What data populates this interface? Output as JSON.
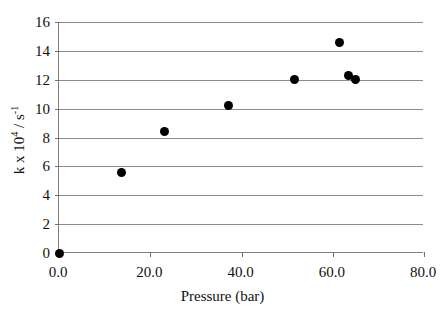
{
  "chart_data": {
    "type": "scatter",
    "title": "",
    "xlabel": "Pressure (bar)",
    "ylabel": "k x 10^4 / s^-1",
    "ylabel_parts": {
      "prefix": "k x 10",
      "exp1": "4",
      "mid": " / s",
      "exp2": "-1"
    },
    "xlim": [
      0.0,
      80.0
    ],
    "ylim": [
      0,
      16
    ],
    "grid": "horizontal",
    "legend": "none",
    "xticks": [
      0.0,
      20.0,
      40.0,
      60.0,
      80.0
    ],
    "xtick_labels": [
      "0.0",
      "20.0",
      "40.0",
      "60.0",
      "80.0"
    ],
    "yticks": [
      0,
      2,
      4,
      6,
      8,
      10,
      12,
      14,
      16
    ],
    "ytick_labels": [
      "0",
      "2",
      "4",
      "6",
      "8",
      "10",
      "12",
      "14",
      "16"
    ],
    "marker": "filled-circle",
    "marker_color": "#000000",
    "series": [
      {
        "name": "k vs Pressure",
        "points": [
          {
            "x": 0.0,
            "y": 0.0
          },
          {
            "x": 13.6,
            "y": 5.6
          },
          {
            "x": 23.2,
            "y": 8.45
          },
          {
            "x": 37.2,
            "y": 10.25
          },
          {
            "x": 51.6,
            "y": 12.0
          },
          {
            "x": 61.5,
            "y": 14.6
          },
          {
            "x": 63.4,
            "y": 12.3
          },
          {
            "x": 64.9,
            "y": 12.0
          }
        ]
      }
    ]
  },
  "figure": {
    "background": "#ffffff",
    "axis_color": "#808080",
    "grid_color": "#8c8c8c",
    "text_color": "#111111"
  }
}
